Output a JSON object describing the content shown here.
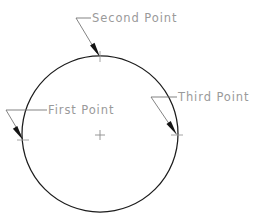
{
  "diagram": {
    "background_color": "#ffffff",
    "shape": {
      "name": "circle",
      "stroke_color": "#1c1c1c",
      "center_x": 100,
      "center_y": 134,
      "radius": 78
    },
    "center_mark": {
      "glyph": "plus",
      "color": "#8d8d8d",
      "x": 100,
      "y": 135,
      "size": 5
    },
    "labels": [
      {
        "id": "first-point",
        "text": "First Point",
        "text_x": 48,
        "text_y": 110,
        "color": "#9a9a9a",
        "leader_horizontal": "M47,110 L6,110",
        "leader_diagonal": "M6,110 L22,137",
        "arrow_x": 23,
        "arrow_y": 140,
        "arrow_angle": 58,
        "tick_x": 23,
        "tick_y": 140
      },
      {
        "id": "second-point",
        "text": "Second Point",
        "text_x": 92,
        "text_y": 18,
        "color": "#9a9a9a",
        "leader_horizontal": "M91,18 L76,18",
        "leader_diagonal": "M76,18 L97,53",
        "arrow_x": 100,
        "arrow_y": 57,
        "arrow_angle": 59,
        "tick_x": 100,
        "tick_y": 57
      },
      {
        "id": "third-point",
        "text": "Third Point",
        "text_x": 178,
        "text_y": 97,
        "color": "#9a9a9a",
        "leader_horizontal": "M177,97 L151,97",
        "leader_diagonal": "M151,97 L174,131",
        "arrow_x": 177,
        "arrow_y": 135,
        "arrow_angle": 56,
        "tick_x": 177,
        "tick_y": 135
      }
    ]
  }
}
